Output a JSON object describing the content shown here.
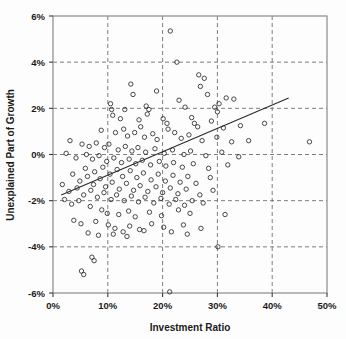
{
  "chart_data": {
    "type": "scatter",
    "title": "",
    "xlabel": "Investment Ratio",
    "ylabel": "Unexplained Part of Growth",
    "xlim": [
      0,
      50
    ],
    "ylim": [
      -6,
      6
    ],
    "xticks": [
      0,
      10,
      20,
      30,
      40,
      50
    ],
    "yticks": [
      -6,
      -4,
      -2,
      0,
      2,
      4,
      6
    ],
    "xtick_labels": [
      "0%",
      "10%",
      "20%",
      "30%",
      "40%",
      "50%"
    ],
    "ytick_labels": [
      "-6%",
      "-4%",
      "-2%",
      "0%",
      "2%",
      "4%",
      "6%"
    ],
    "grid": true,
    "grid_style": "dashed",
    "legend": null,
    "marker": "open-circle",
    "marker_color": "#2b2b2b",
    "marker_size": 4.4,
    "trendline": {
      "type": "linear-fit",
      "x_start": 1.5,
      "y_start": -1.75,
      "x_end": 43.0,
      "y_end": 2.45,
      "color": "#2b2b2b"
    },
    "points": [
      [
        21.4,
        5.35
      ],
      [
        22.6,
        4.0
      ],
      [
        26.6,
        3.45
      ],
      [
        27.6,
        3.3
      ],
      [
        26.9,
        2.95
      ],
      [
        28.2,
        2.6
      ],
      [
        14.2,
        3.05
      ],
      [
        14.6,
        2.6
      ],
      [
        18.9,
        2.75
      ],
      [
        31.6,
        2.45
      ],
      [
        33.0,
        2.4
      ],
      [
        10.5,
        2.2
      ],
      [
        10.7,
        1.95
      ],
      [
        10.9,
        1.7
      ],
      [
        23.0,
        2.35
      ],
      [
        24.1,
        2.05
      ],
      [
        17.0,
        2.1
      ],
      [
        17.5,
        1.95
      ],
      [
        17.2,
        1.75
      ],
      [
        13.1,
        1.95
      ],
      [
        29.5,
        2.05
      ],
      [
        30.0,
        1.85
      ],
      [
        30.3,
        2.2
      ],
      [
        12.3,
        1.55
      ],
      [
        15.7,
        1.5
      ],
      [
        16.0,
        1.2
      ],
      [
        20.1,
        1.55
      ],
      [
        20.8,
        1.35
      ],
      [
        21.0,
        1.1
      ],
      [
        25.3,
        1.6
      ],
      [
        25.8,
        1.35
      ],
      [
        26.4,
        1.2
      ],
      [
        28.9,
        1.45
      ],
      [
        31.1,
        1.15
      ],
      [
        34.2,
        1.25
      ],
      [
        38.6,
        1.35
      ],
      [
        8.8,
        1.05
      ],
      [
        11.4,
        0.95
      ],
      [
        12.9,
        1.1
      ],
      [
        13.6,
        0.8
      ],
      [
        14.9,
        0.95
      ],
      [
        16.7,
        0.75
      ],
      [
        18.2,
        0.9
      ],
      [
        19.0,
        0.65
      ],
      [
        22.2,
        0.95
      ],
      [
        23.4,
        0.7
      ],
      [
        24.8,
        0.85
      ],
      [
        27.2,
        0.6
      ],
      [
        29.9,
        0.75
      ],
      [
        32.6,
        0.55
      ],
      [
        35.7,
        0.6
      ],
      [
        46.8,
        0.55
      ],
      [
        3.1,
        0.6
      ],
      [
        5.3,
        0.45
      ],
      [
        6.6,
        0.35
      ],
      [
        7.9,
        0.5
      ],
      [
        9.4,
        0.3
      ],
      [
        10.2,
        0.45
      ],
      [
        11.9,
        0.2
      ],
      [
        13.2,
        0.35
      ],
      [
        14.4,
        0.15
      ],
      [
        15.5,
        0.3
      ],
      [
        16.9,
        0.1
      ],
      [
        18.6,
        0.25
      ],
      [
        20.3,
        0.05
      ],
      [
        21.8,
        0.2
      ],
      [
        23.9,
        0.0
      ],
      [
        25.1,
        0.15
      ],
      [
        27.9,
        -0.05
      ],
      [
        30.8,
        0.1
      ],
      [
        33.9,
        -0.1
      ],
      [
        2.4,
        0.05
      ],
      [
        4.2,
        -0.15
      ],
      [
        6.1,
        0.0
      ],
      [
        7.2,
        -0.2
      ],
      [
        8.4,
        -0.05
      ],
      [
        9.8,
        -0.3
      ],
      [
        11.1,
        -0.15
      ],
      [
        12.5,
        -0.35
      ],
      [
        13.9,
        -0.2
      ],
      [
        15.1,
        -0.4
      ],
      [
        16.3,
        -0.25
      ],
      [
        17.8,
        -0.45
      ],
      [
        19.4,
        -0.3
      ],
      [
        20.6,
        -0.5
      ],
      [
        22.0,
        -0.35
      ],
      [
        23.6,
        -0.55
      ],
      [
        25.6,
        -0.4
      ],
      [
        28.4,
        -0.6
      ],
      [
        31.9,
        -0.45
      ],
      [
        5.9,
        -0.6
      ],
      [
        7.6,
        -0.75
      ],
      [
        9.1,
        -0.55
      ],
      [
        10.4,
        -0.85
      ],
      [
        11.7,
        -0.65
      ],
      [
        12.7,
        -0.95
      ],
      [
        14.1,
        -0.7
      ],
      [
        15.3,
        -1.0
      ],
      [
        16.5,
        -0.8
      ],
      [
        17.9,
        -1.1
      ],
      [
        19.2,
        -0.85
      ],
      [
        20.5,
        -1.15
      ],
      [
        21.9,
        -0.9
      ],
      [
        23.2,
        -1.2
      ],
      [
        24.6,
        -0.95
      ],
      [
        26.1,
        -1.25
      ],
      [
        28.7,
        -1.0
      ],
      [
        3.6,
        -0.85
      ],
      [
        4.9,
        -1.15
      ],
      [
        6.3,
        -0.95
      ],
      [
        7.4,
        -1.3
      ],
      [
        8.6,
        -1.05
      ],
      [
        9.6,
        -1.4
      ],
      [
        10.8,
        -1.2
      ],
      [
        12.1,
        -1.5
      ],
      [
        13.4,
        -1.25
      ],
      [
        14.7,
        -1.55
      ],
      [
        15.9,
        -1.35
      ],
      [
        17.3,
        -1.6
      ],
      [
        18.8,
        -1.4
      ],
      [
        20.0,
        -1.65
      ],
      [
        21.4,
        -1.45
      ],
      [
        22.8,
        -1.7
      ],
      [
        24.3,
        -1.5
      ],
      [
        26.8,
        -1.75
      ],
      [
        29.2,
        -1.55
      ],
      [
        1.7,
        -1.3
      ],
      [
        2.9,
        -1.6
      ],
      [
        4.4,
        -1.45
      ],
      [
        5.6,
        -1.75
      ],
      [
        6.9,
        -1.55
      ],
      [
        8.1,
        -1.85
      ],
      [
        9.3,
        -1.65
      ],
      [
        10.6,
        -1.95
      ],
      [
        11.6,
        -1.75
      ],
      [
        13.0,
        -2.0
      ],
      [
        14.3,
        -1.8
      ],
      [
        15.6,
        -2.05
      ],
      [
        16.8,
        -1.85
      ],
      [
        18.4,
        -2.1
      ],
      [
        19.7,
        -1.9
      ],
      [
        21.2,
        -2.15
      ],
      [
        22.4,
        -1.95
      ],
      [
        24.0,
        -2.2
      ],
      [
        25.4,
        -2.0
      ],
      [
        27.4,
        -2.1
      ],
      [
        2.1,
        -1.95
      ],
      [
        3.4,
        -2.15
      ],
      [
        4.7,
        -2.0
      ],
      [
        6.8,
        -2.25
      ],
      [
        8.9,
        -2.4
      ],
      [
        9.9,
        -2.55
      ],
      [
        12.0,
        -2.6
      ],
      [
        13.8,
        -2.45
      ],
      [
        15.0,
        -2.7
      ],
      [
        17.6,
        -2.5
      ],
      [
        19.8,
        -2.65
      ],
      [
        22.9,
        -2.4
      ],
      [
        25.0,
        -2.55
      ],
      [
        31.4,
        -2.6
      ],
      [
        3.8,
        -2.85
      ],
      [
        5.1,
        -3.0
      ],
      [
        7.8,
        -2.9
      ],
      [
        10.1,
        -3.05
      ],
      [
        11.3,
        -3.2
      ],
      [
        12.8,
        -3.35
      ],
      [
        14.0,
        -3.1
      ],
      [
        15.8,
        -3.25
      ],
      [
        18.0,
        -3.0
      ],
      [
        20.2,
        -3.15
      ],
      [
        23.8,
        -3.05
      ],
      [
        27.0,
        -3.2
      ],
      [
        6.4,
        -3.4
      ],
      [
        8.3,
        -3.5
      ],
      [
        11.0,
        -3.45
      ],
      [
        13.5,
        -3.55
      ],
      [
        16.6,
        -3.3
      ],
      [
        21.6,
        -3.35
      ],
      [
        24.5,
        -3.45
      ],
      [
        30.1,
        -4.0
      ],
      [
        7.1,
        -4.45
      ],
      [
        7.5,
        -4.6
      ],
      [
        5.2,
        -5.05
      ],
      [
        5.6,
        -5.2
      ],
      [
        21.3,
        -5.95
      ]
    ]
  }
}
